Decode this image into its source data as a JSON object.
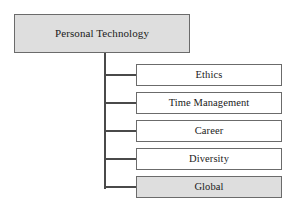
{
  "diagram": {
    "type": "hierarchy-tree",
    "background_color": "#ffffff",
    "root": {
      "label": "Personal Technology",
      "fill_color": "#dedede",
      "border_color": "#6b6b6b"
    },
    "children": [
      {
        "label": "Ethics",
        "fill_color": "#ffffff",
        "border_color": "#6b6b6b"
      },
      {
        "label": "Time Management",
        "fill_color": "#ffffff",
        "border_color": "#6b6b6b"
      },
      {
        "label": "Career",
        "fill_color": "#ffffff",
        "border_color": "#6b6b6b"
      },
      {
        "label": "Diversity",
        "fill_color": "#ffffff",
        "border_color": "#6b6b6b"
      },
      {
        "label": "Global",
        "fill_color": "#dedede",
        "border_color": "#6b6b6b"
      }
    ],
    "connector_color": "#4a4a4a"
  }
}
